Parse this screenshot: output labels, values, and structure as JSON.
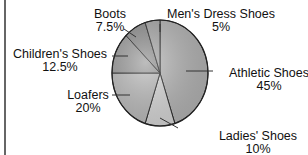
{
  "chart_data": {
    "type": "pie",
    "title": "",
    "categories": [
      "Athletic Shoes",
      "Ladies' Shoes",
      "Loafers",
      "Children's Shoes",
      "Boots",
      "Men's Dress Shoes"
    ],
    "values": [
      45,
      10,
      20,
      12.5,
      7.5,
      5
    ],
    "unit": "%",
    "start_angle_deg": 0,
    "direction": "clockwise from top",
    "legend": "none (direct labels with leader lines)",
    "labels": [
      {
        "name": "Athletic Shoes",
        "pct": "45%"
      },
      {
        "name": "Ladies' Shoes",
        "pct": "10%"
      },
      {
        "name": "Loafers",
        "pct": "20%"
      },
      {
        "name": "Children's Shoes",
        "pct": "12.5%"
      },
      {
        "name": "Boots",
        "pct": "7.5%"
      },
      {
        "name": "Men's Dress Shoes",
        "pct": "5%"
      }
    ],
    "colors": [
      "#b8b8b8",
      "#dcdcdc",
      "#bdbdbd",
      "#9a9a9a",
      "#8e8e8e",
      "#a8a8a8"
    ]
  }
}
